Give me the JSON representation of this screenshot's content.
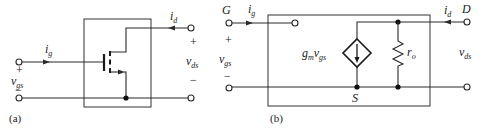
{
  "figure": {
    "panel_a": {
      "caption": "(a)",
      "gate_current": {
        "symbol": "i",
        "sub": "g"
      },
      "drain_current": {
        "symbol": "i",
        "sub": "d"
      },
      "input_voltage": {
        "plus": "+",
        "symbol": "v",
        "sub": "gs",
        "minus": "−"
      },
      "output_voltage": {
        "plus": "+",
        "symbol": "v",
        "sub": "ds",
        "minus": "−"
      },
      "device": "n-channel enhancement MOSFET"
    },
    "panel_b": {
      "caption": "(b)",
      "gate_label": "G",
      "drain_label": "D",
      "source_label": "S",
      "gate_current": {
        "symbol": "i",
        "sub": "g"
      },
      "drain_current": {
        "symbol": "i",
        "sub": "d"
      },
      "input_voltage": {
        "plus": "+",
        "symbol": "v",
        "sub": "gs",
        "minus": "−"
      },
      "output_voltage": {
        "symbol": "v",
        "sub": "ds"
      },
      "dependent_source": {
        "g": "g",
        "g_sub": "m",
        "v": "v",
        "v_sub": "gs"
      },
      "resistor": {
        "symbol": "r",
        "sub": "o"
      }
    }
  },
  "colors": {
    "line": "#2a2a2a",
    "background": "#ffffff"
  }
}
